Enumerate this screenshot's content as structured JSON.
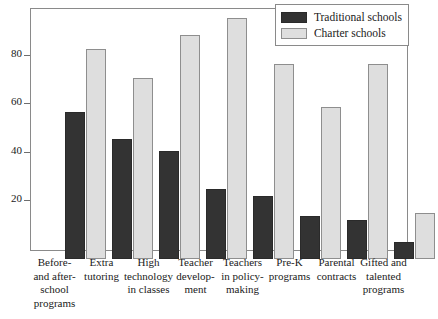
{
  "chart_data": {
    "type": "bar",
    "title": "",
    "subtitle": "",
    "xlabel": "",
    "ylabel": "",
    "ylim": [
      0,
      100
    ],
    "yticks": [
      20,
      40,
      60,
      80
    ],
    "ytick_labels": [
      "20",
      "40",
      "60",
      "80"
    ],
    "grid": false,
    "legend_position": "top-right",
    "categories": [
      "Before- and after-school programs",
      "Extra tutoring",
      "High technology in classes",
      "Teacher development",
      "Teachers in policy-making",
      "Pre-K programs",
      "Parental contracts",
      "Gifted and talented programs"
    ],
    "category_lines": [
      [
        "Before-",
        "and after-",
        "school",
        "programs"
      ],
      [
        "Extra",
        "tutoring"
      ],
      [
        "High",
        "technology",
        "in classes"
      ],
      [
        "Teacher",
        "develop-",
        "ment"
      ],
      [
        "Teachers",
        "in policy-",
        "making"
      ],
      [
        "Pre-K",
        "programs"
      ],
      [
        "Parental",
        "contracts"
      ],
      [
        "Gifted and",
        "talented",
        "programs"
      ]
    ],
    "series": [
      {
        "name": "Traditional schools",
        "color": "#333333",
        "values": [
          61,
          50,
          45,
          29,
          26,
          18,
          16,
          7
        ]
      },
      {
        "name": "Charter schools",
        "color": "#dedede",
        "values": [
          87,
          75,
          93,
          100,
          81,
          63,
          81,
          19
        ]
      }
    ]
  },
  "legend": {
    "items": [
      {
        "label": "Traditional schools",
        "swatch": "traditional"
      },
      {
        "label": "Charter schools",
        "swatch": "charter"
      }
    ]
  }
}
